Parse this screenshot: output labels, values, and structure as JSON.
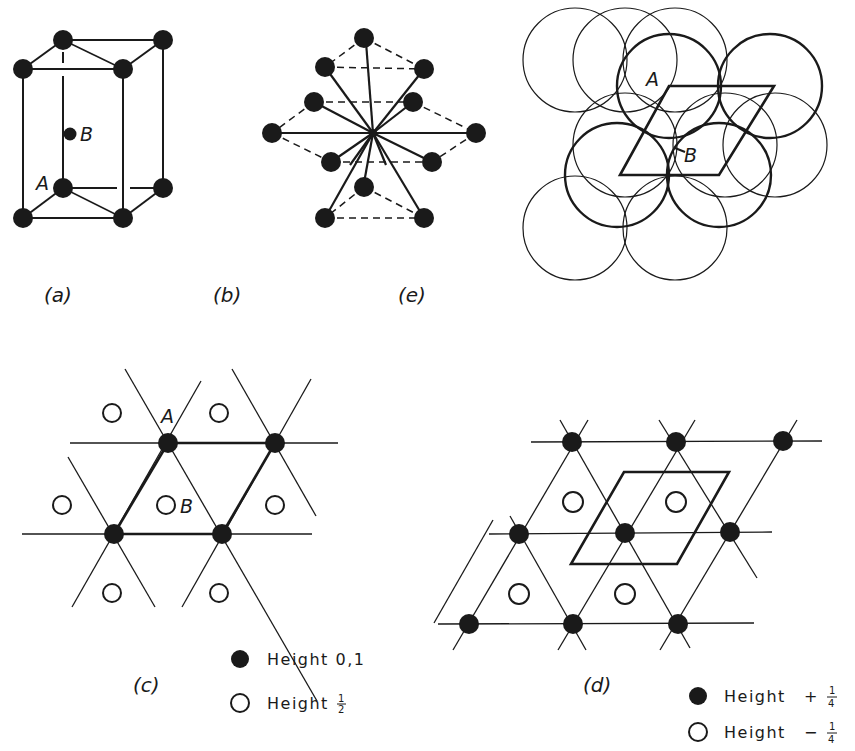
{
  "figure": {
    "panels": {
      "a": {
        "caption": "(a)",
        "description": "Hexagonal close-packed conventional cell (prism)",
        "labels": {
          "A": "A",
          "B": "B"
        }
      },
      "b": {
        "caption": "(b)",
        "description": "Twelve nearest neighbours around a central atom in hcp"
      },
      "e": {
        "caption": "(e)",
        "description": "Close-packed layers of spheres with rhombic unit cell",
        "labels": {
          "A": "A",
          "B": "B"
        }
      },
      "c": {
        "caption": "(c)",
        "description": "Plan view of hcp with rhombic cell",
        "labels": {
          "A": "A",
          "B": "B"
        },
        "legend": [
          {
            "marker": "filled-circle",
            "label": "Height 0,1"
          },
          {
            "marker": "open-circle",
            "label": "Height",
            "fraction": {
              "num": "1",
              "den": "2"
            }
          }
        ]
      },
      "d": {
        "caption": "(d)",
        "description": "Plan view with origin shifted",
        "legend": [
          {
            "marker": "filled-circle",
            "label": "Height",
            "sign": "+",
            "fraction": {
              "num": "1",
              "den": "4"
            }
          },
          {
            "marker": "open-circle",
            "label": "Height",
            "sign": "−",
            "fraction": {
              "num": "1",
              "den": "4"
            }
          }
        ]
      }
    },
    "colors": {
      "ink": "#1a1a1a",
      "background": "#ffffff"
    }
  }
}
